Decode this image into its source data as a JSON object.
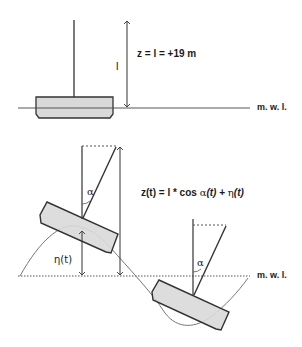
{
  "top_panel": {
    "formula": "z = l = +19 m",
    "length_label": "l",
    "waterline_label": "m. w. l."
  },
  "bottom_panel": {
    "formula_prefix": "z(t) = l * cos ",
    "formula_alpha": "α",
    "formula_alpha_arg": "(t)",
    "formula_plus": " + ",
    "formula_eta": "η",
    "formula_eta_arg": "(t)",
    "eta_label": "η(t)",
    "alpha_label_left": "α",
    "alpha_label_right": "α",
    "waterline_label": "m. w. l."
  },
  "colors": {
    "line": "#333333",
    "hull_fill": "#d9d9d9",
    "wave": "#777777"
  }
}
